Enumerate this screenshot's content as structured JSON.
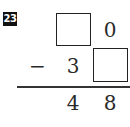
{
  "problem": {
    "number": "23",
    "operator": "−",
    "minuend": {
      "tens": "",
      "ones": "0",
      "tens_is_blank_box": true
    },
    "subtrahend": {
      "tens": "3",
      "ones": "",
      "ones_is_blank_box": true
    },
    "result": {
      "tens": "4",
      "ones": "8"
    }
  },
  "colors": {
    "badge_bg": "#111111",
    "badge_text": "#ffffff",
    "text": "#2a2a2a",
    "box_border": "#222222",
    "rule": "#333333"
  }
}
